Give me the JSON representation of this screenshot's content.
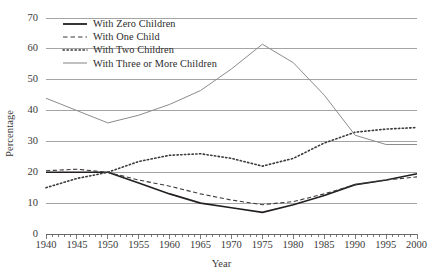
{
  "chart_data": {
    "type": "line",
    "title": "",
    "xlabel": "Year",
    "ylabel": "Percentage",
    "xlim": [
      1940,
      2000
    ],
    "ylim": [
      0,
      70
    ],
    "grid": true,
    "legend_position": "upper-left-inside",
    "y_ticks": [
      0,
      10,
      20,
      30,
      40,
      50,
      60,
      70
    ],
    "x_ticks": [
      1940,
      1945,
      1950,
      1955,
      1960,
      1965,
      1970,
      1975,
      1980,
      1985,
      1990,
      1995,
      2000
    ],
    "x_minor_tick_interval": 1,
    "x": [
      1940,
      1945,
      1950,
      1955,
      1960,
      1965,
      1970,
      1975,
      1980,
      1985,
      1990,
      1995,
      2000
    ],
    "series": [
      {
        "name": "With Zero Children",
        "style": "solid",
        "color": "#231f20",
        "width": 1.6,
        "values": [
          20,
          20,
          20,
          16.5,
          13,
          10,
          8.5,
          7,
          9.5,
          12.5,
          16,
          17.5,
          19.5
        ]
      },
      {
        "name": "With One Child",
        "style": "dashed",
        "color": "#3b3b3b",
        "width": 1.1,
        "values": [
          20.5,
          21,
          20,
          17.5,
          15.5,
          13,
          11,
          9.5,
          10.5,
          13,
          16,
          17.5,
          18.5
        ]
      },
      {
        "name": "With Two Children",
        "style": "dotted",
        "color": "#3b3b3b",
        "width": 1.6,
        "values": [
          15,
          18,
          20,
          23.5,
          25.5,
          26,
          24.5,
          22,
          24.5,
          29.5,
          33,
          34,
          34.5
        ]
      },
      {
        "name": "With Three or More Children",
        "style": "solid",
        "color": "#8c8c8c",
        "width": 1.0,
        "values": [
          44,
          40,
          36,
          38.5,
          42,
          46.5,
          53.5,
          61.5,
          55.5,
          45,
          32,
          29,
          29
        ]
      }
    ]
  },
  "axes": {
    "y_tick_labels": [
      "0",
      "10",
      "20",
      "30",
      "40",
      "50",
      "60",
      "70"
    ],
    "x_tick_labels": [
      "1940",
      "1945",
      "1950",
      "1955",
      "1960",
      "1965",
      "1970",
      "1975",
      "1980",
      "1985",
      "1990",
      "1995",
      "2000"
    ],
    "xlabel": "Year",
    "ylabel": "Percentage"
  },
  "legend": {
    "items": [
      {
        "label": "With Zero Children",
        "swatch": "solid-thick-dark-line-icon"
      },
      {
        "label": "With One Child",
        "swatch": "dashed-line-icon"
      },
      {
        "label": "With Two Children",
        "swatch": "dotted-line-icon"
      },
      {
        "label": "With Three or More Children",
        "swatch": "solid-thin-gray-line-icon"
      }
    ]
  },
  "colors": {
    "gridline": "#9a9a9a",
    "axis": "#5a5a5a",
    "dark_series": "#231f20",
    "gray_series": "#8c8c8c",
    "text": "#2b2b2b"
  }
}
